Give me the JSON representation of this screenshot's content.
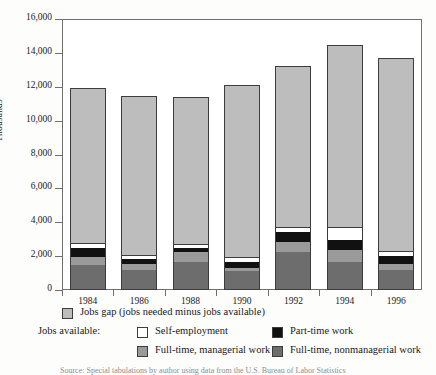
{
  "chart_data": {
    "type": "bar",
    "subtype": "stacked-bar",
    "title": "",
    "xlabel": "",
    "ylabel": "Thousands",
    "ylim": [
      0,
      16000
    ],
    "ytick_step": 2000,
    "ytick_labels": [
      "16,000",
      "14,000",
      "12,000",
      "10,000",
      "8,000",
      "6,000",
      "4,000",
      "2,000",
      "0"
    ],
    "ytick_values": [
      16000,
      14000,
      12000,
      10000,
      8000,
      6000,
      4000,
      2000,
      0
    ],
    "categories": [
      "1984",
      "1986",
      "1988",
      "1990",
      "1992",
      "1994",
      "1996"
    ],
    "grid": false,
    "legend_position": "below",
    "series": [
      {
        "name": "Full-time, nonmanagerial work",
        "color": "#6d6d6d",
        "values": [
          1480,
          1180,
          1660,
          1120,
          2250,
          1660,
          1180
        ]
      },
      {
        "name": "Full-time, managerial work",
        "color": "#9a9a9a",
        "values": [
          470,
          360,
          590,
          180,
          590,
          710,
          350
        ]
      },
      {
        "name": "Part-time work",
        "color": "#111111",
        "values": [
          530,
          300,
          240,
          350,
          590,
          590,
          470
        ]
      },
      {
        "name": "Self-employment",
        "color": "#ffffff",
        "values": [
          240,
          180,
          180,
          240,
          240,
          710,
          240
        ]
      },
      {
        "name": "Jobs gap (jobs needed minus jobs available)",
        "color": "#bdbdbd",
        "values": [
          9230,
          9460,
          8730,
          10230,
          9530,
          10810,
          11430
        ]
      }
    ],
    "totals": [
      11950,
      11480,
      11400,
      12120,
      13200,
      13880,
      14190
    ]
  },
  "axis": {
    "y_title": "Thousands"
  },
  "legend": {
    "gap_label": "Jobs gap (jobs needed minus jobs available)",
    "available_prefix": "Jobs available:",
    "self_label": "Self-employment",
    "part_label": "Part-time work",
    "mgr_label": "Full-time, managerial work",
    "nonmgr_label": "Full-time, nonmanagerial work"
  },
  "footer": {
    "source": "Source: Special tabulations by author using data from the U.S. Bureau of Labor Statistics"
  },
  "colors": {
    "gap": "#bdbdbd",
    "self_employment": "#ffffff",
    "part_time": "#111111",
    "managerial": "#9a9a9a",
    "nonmanagerial": "#6d6d6d",
    "axis": "#6f6f6f",
    "outline": "#3d3d3d"
  }
}
